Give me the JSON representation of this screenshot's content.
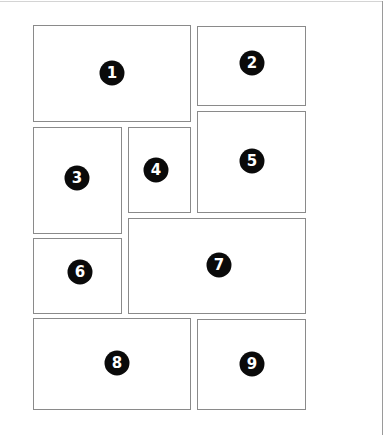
{
  "diagram": {
    "type": "comic-page-panel-layout",
    "border_color": "#8a8a8a",
    "badge_color": "#0a0a0a",
    "badge_text_color": "#ffffff",
    "panels": [
      {
        "label": "1",
        "x": 33,
        "y": 25,
        "w": 158,
        "h": 97,
        "badge_x": 112,
        "badge_y": 73
      },
      {
        "label": "2",
        "x": 197,
        "y": 26,
        "w": 109,
        "h": 80,
        "badge_x": 252,
        "badge_y": 63
      },
      {
        "label": "3",
        "x": 33,
        "y": 127,
        "w": 89,
        "h": 107,
        "badge_x": 77,
        "badge_y": 178
      },
      {
        "label": "4",
        "x": 128,
        "y": 127,
        "w": 63,
        "h": 86,
        "badge_x": 156,
        "badge_y": 170
      },
      {
        "label": "5",
        "x": 197,
        "y": 111,
        "w": 109,
        "h": 102,
        "badge_x": 252,
        "badge_y": 161
      },
      {
        "label": "6",
        "x": 33,
        "y": 238,
        "w": 89,
        "h": 76,
        "badge_x": 80,
        "badge_y": 272
      },
      {
        "label": "7",
        "x": 128,
        "y": 218,
        "w": 178,
        "h": 96,
        "badge_x": 219,
        "badge_y": 265
      },
      {
        "label": "8",
        "x": 33,
        "y": 318,
        "w": 158,
        "h": 92,
        "badge_x": 117,
        "badge_y": 363
      },
      {
        "label": "9",
        "x": 197,
        "y": 319,
        "w": 109,
        "h": 91,
        "badge_x": 252,
        "badge_y": 364
      }
    ]
  }
}
